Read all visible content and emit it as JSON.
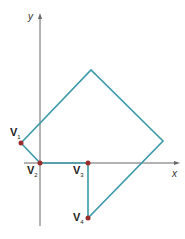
{
  "axes": {
    "x_label": "x",
    "y_label": "y"
  },
  "vertices": [
    {
      "name": "V",
      "sub": "1"
    },
    {
      "name": "V",
      "sub": "2"
    },
    {
      "name": "V",
      "sub": "3"
    },
    {
      "name": "V",
      "sub": "4"
    }
  ],
  "colors": {
    "polygon": "#3a9aa8",
    "vertex": "#9b2c2c",
    "axis": "#555555"
  }
}
